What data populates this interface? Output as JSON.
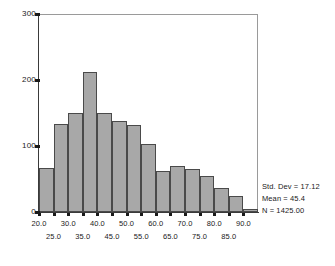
{
  "chart_data": {
    "type": "bar",
    "title": "",
    "subtitle": "",
    "xlabel": "",
    "ylabel": "",
    "grid": false,
    "legend_position": "right-bottom",
    "xlim": [
      20.0,
      95.0
    ],
    "ylim": [
      0,
      300
    ],
    "bin_width": 5,
    "categories": [
      "20-25",
      "25-30",
      "30-35",
      "35-40",
      "40-45",
      "45-50",
      "50-55",
      "55-60",
      "60-65",
      "65-70",
      "70-75",
      "75-80",
      "80-85",
      "85-90",
      "90-95"
    ],
    "bin_starts": [
      20,
      25,
      30,
      35,
      40,
      45,
      50,
      55,
      60,
      65,
      70,
      75,
      80,
      85,
      90
    ],
    "values": [
      67,
      133,
      150,
      212,
      150,
      138,
      132,
      103,
      62,
      70,
      65,
      54,
      37,
      25,
      5
    ],
    "y_ticks": [
      0,
      100,
      200,
      300
    ],
    "y_tick_labels": [
      "0",
      "100",
      "200",
      "300"
    ],
    "x_ticks_upper": [
      20.0,
      30.0,
      40.0,
      50.0,
      60.0,
      70.0,
      80.0,
      90.0
    ],
    "x_tick_labels_upper": [
      "20.0",
      "30.0",
      "40.0",
      "50.0",
      "60.0",
      "70.0",
      "80.0",
      "90.0"
    ],
    "x_ticks_lower": [
      25.0,
      35.0,
      45.0,
      55.0,
      65.0,
      75.0,
      85.0
    ],
    "x_tick_labels_lower": [
      "25.0",
      "35.0",
      "45.0",
      "55.0",
      "65.0",
      "75.0",
      "85.0"
    ],
    "bar_color": "#a8a8a8",
    "bar_edge_color": "#4a4a4a",
    "axis_color": "#3a3a3a",
    "text_color": "#1a1a1a"
  },
  "stats": {
    "std_dev": "Std. Dev = 17.12",
    "mean": "Mean = 45.4",
    "n": "N = 1425.00"
  }
}
